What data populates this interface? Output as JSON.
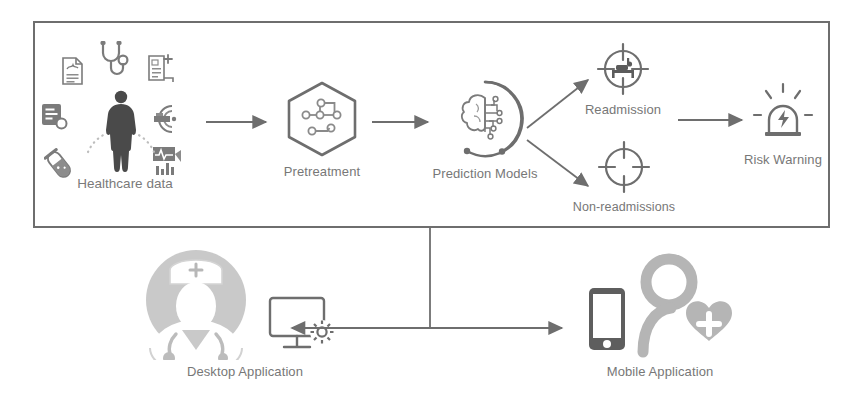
{
  "figure": {
    "title": "Healthcare readmission prediction system architecture",
    "background_color": "#ffffff",
    "frame_color": "#6e6e6e",
    "label_color": "#777777",
    "icon_color": "#6e6e6e",
    "icon_accent_color": "#9a9a9a"
  },
  "pipeline": {
    "frame_label": "",
    "nodes": [
      {
        "id": "healthcare-data",
        "label": "Healthcare data",
        "icon": "human-body-data-icon"
      },
      {
        "id": "pretreatment",
        "label": "Pretreatment",
        "icon": "hexagon-nodes-icon"
      },
      {
        "id": "prediction-models",
        "label": "Prediction Models",
        "icon": "brain-circuit-icon"
      },
      {
        "id": "readmission",
        "label": "Readmission",
        "icon": "crosshair-hospital-bed-icon"
      },
      {
        "id": "non-readmissions",
        "label": "Non-readmissions",
        "icon": "crosshair-empty-icon"
      },
      {
        "id": "risk-warning",
        "label": "Risk Warning",
        "icon": "alarm-siren-icon"
      }
    ]
  },
  "data_sources": {
    "cluster_label": "Healthcare data",
    "icons": [
      {
        "id": "medical-record",
        "name": "medical-record-document-icon"
      },
      {
        "id": "stethoscope",
        "name": "stethoscope-icon"
      },
      {
        "id": "prescription",
        "name": "prescription-document-plus-icon"
      },
      {
        "id": "clipboard-report",
        "name": "clipboard-report-icon"
      },
      {
        "id": "test-tube",
        "name": "test-tube-sample-icon"
      },
      {
        "id": "mri-scanner",
        "name": "mri-scanner-icon"
      },
      {
        "id": "ecg-monitor",
        "name": "ecg-vitals-chart-icon"
      },
      {
        "id": "patient-body",
        "name": "human-body-silhouette-icon"
      }
    ]
  },
  "applications": {
    "nodes": [
      {
        "id": "desktop-application",
        "label": "Desktop Application",
        "icons": [
          "nurse-avatar-icon",
          "desktop-monitor-gear-icon"
        ]
      },
      {
        "id": "mobile-application",
        "label": "Mobile Application",
        "icons": [
          "smartphone-icon",
          "patient-heart-plus-icon"
        ]
      }
    ]
  },
  "connectors": [
    {
      "id": "data-to-pretreatment",
      "type": "arrow",
      "direction": "right"
    },
    {
      "id": "pretreatment-to-models",
      "type": "arrow",
      "direction": "right"
    },
    {
      "id": "models-to-readmission",
      "type": "arrow",
      "direction": "up-right"
    },
    {
      "id": "models-to-non-readmissions",
      "type": "arrow",
      "direction": "down-right"
    },
    {
      "id": "readmission-to-risk-warning",
      "type": "arrow",
      "direction": "right"
    },
    {
      "id": "frame-to-applications",
      "type": "line",
      "direction": "down"
    },
    {
      "id": "applications-bus",
      "type": "double-arrow",
      "direction": "horizontal"
    }
  ]
}
